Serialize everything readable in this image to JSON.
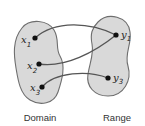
{
  "diagram": {
    "type": "function-mapping",
    "sets": [
      {
        "name": "domain",
        "label": "Domain",
        "elements": [
          {
            "id": "x1",
            "base": "x",
            "sub": "1"
          },
          {
            "id": "x2",
            "base": "x",
            "sub": "2"
          },
          {
            "id": "x3",
            "base": "x",
            "sub": "3"
          }
        ]
      },
      {
        "name": "range",
        "label": "Range",
        "elements": [
          {
            "id": "y1",
            "base": "y",
            "sub": "1"
          },
          {
            "id": "y3",
            "base": "y",
            "sub": "3"
          }
        ]
      }
    ],
    "mappings": [
      {
        "from": "x1",
        "to": "y1"
      },
      {
        "from": "x2",
        "to": "y1"
      },
      {
        "from": "x3",
        "to": "y3"
      }
    ],
    "colors": {
      "blob_fill": "#d9d9d9",
      "blob_stroke": "#6e6e6e",
      "arrow": "#555555",
      "dot": "#111111"
    }
  }
}
